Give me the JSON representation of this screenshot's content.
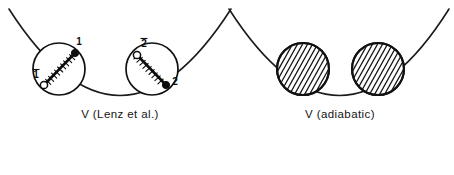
{
  "figure": {
    "background_color": "#ffffff",
    "ink_color": "#111111",
    "width": 454,
    "height": 175
  },
  "panels": [
    {
      "id": "lenz",
      "caption": "V (Lenz et al.)",
      "caption_x": 120,
      "caption_y": 118,
      "well": {
        "name": "parabolic-potential-curve",
        "path": "M 9 9 Q 120 182 231 9",
        "vertex_x": 120,
        "vertex_y": 163
      },
      "circles": [
        {
          "id": "site-1",
          "cx": 59,
          "cy": 69,
          "r": 26,
          "style": "outline",
          "molecule": {
            "filled_end": {
              "x": 75,
              "y": 53,
              "r": 3.6
            },
            "open_end": {
              "x": 44,
              "y": 85,
              "r": 3.6
            },
            "tick_count": 9
          },
          "labels": [
            {
              "text": "1",
              "overbar": false,
              "x": 79,
              "y": 45
            },
            {
              "text": "1",
              "overbar": true,
              "x": 36,
              "y": 78
            }
          ]
        },
        {
          "id": "site-2",
          "cx": 152,
          "cy": 69,
          "r": 26,
          "style": "outline",
          "molecule": {
            "filled_end": {
              "x": 166,
              "y": 85,
              "r": 3.6
            },
            "open_end": {
              "x": 137,
              "y": 55,
              "r": 3.6
            },
            "tick_count": 9
          },
          "labels": [
            {
              "text": "2",
              "overbar": true,
              "x": 144,
              "y": 47
            },
            {
              "text": "2",
              "overbar": false,
              "x": 175,
              "y": 85
            }
          ]
        }
      ]
    },
    {
      "id": "adiabatic",
      "caption": "V (adiabatic)",
      "caption_x": 340,
      "caption_y": 118,
      "well": {
        "name": "parabolic-potential-curve",
        "path": "M 229 9 Q 340 182 449 9",
        "vertex_x": 340,
        "vertex_y": 163
      },
      "circles": [
        {
          "id": "site-a",
          "cx": 303,
          "cy": 69,
          "r": 27,
          "style": "hatched",
          "hatch_angle_deg": 45,
          "hatch_spacing": 5,
          "molecule": null,
          "labels": []
        },
        {
          "id": "site-b",
          "cx": 378,
          "cy": 69,
          "r": 27,
          "style": "hatched",
          "hatch_angle_deg": 45,
          "hatch_spacing": 5,
          "molecule": null,
          "labels": []
        }
      ]
    }
  ]
}
